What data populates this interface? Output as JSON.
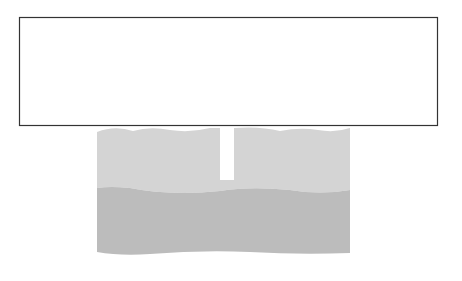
{
  "diagram": {
    "labels": {
      "land_surface": "Land Surface",
      "water_table_well_line1": "Water-Table",
      "water_table_well_line2": "Well",
      "unsaturated_zone_line1": "Unsaturated",
      "unsaturated_zone_line2": "Zone",
      "sand": "Sand",
      "water_table": "Water Table",
      "saturated_zone_line1": "Saturated",
      "saturated_zone_line2": "Zone",
      "clay": "Clay",
      "unconfined_aquifer_line1": "Unconfined",
      "unconfined_aquifer_line2": "Aquifer"
    },
    "layers": [
      {
        "name": "Sand (unsaturated)",
        "color": "#ffffff"
      },
      {
        "name": "Saturated gravel/sand",
        "color": "#d4d4d4"
      },
      {
        "name": "Clay",
        "color": "#bdbdbd"
      }
    ],
    "colors": {
      "line": "#2a2a2a",
      "saturated": "#d4d4d4",
      "clay": "#bcbcbc",
      "frame": "#333333"
    }
  }
}
